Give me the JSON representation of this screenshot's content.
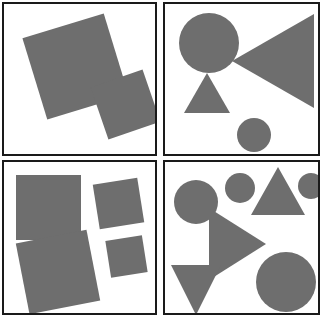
{
  "figure": {
    "width": 323,
    "height": 318,
    "background_color": "#ffffff",
    "shape_fill_color": "#6e6e6e",
    "border_color": "#1a1a1a",
    "layout": "2x2-grid-of-bordered-panels",
    "panel_count": 4
  },
  "panels": [
    {
      "id": "top-left",
      "position": "top-left",
      "shape_count": 2,
      "shapes": [
        {
          "name": "square-large-rotated",
          "type": "square",
          "size": 85,
          "rotation_deg": -17,
          "center_x": 72,
          "center_y": 63
        },
        {
          "name": "square-small-rotated",
          "type": "square",
          "size": 55,
          "rotation_deg": -19,
          "center_x": 122,
          "center_y": 101
        }
      ]
    },
    {
      "id": "top-right",
      "position": "top-right",
      "shape_count": 4,
      "shapes": [
        {
          "name": "circle-large",
          "type": "circle",
          "diameter": 60,
          "center_x": 44,
          "center_y": 39
        },
        {
          "name": "triangle-left-pointing-large",
          "type": "triangle",
          "direction": "left",
          "width": 82,
          "height": 94,
          "center_x": 108,
          "center_y": 57
        },
        {
          "name": "triangle-up-pointing-small",
          "type": "triangle",
          "direction": "up",
          "width": 46,
          "height": 40,
          "center_x": 42,
          "center_y": 89
        },
        {
          "name": "circle-small",
          "type": "circle",
          "diameter": 34,
          "center_x": 89,
          "center_y": 131
        }
      ]
    },
    {
      "id": "bottom-left",
      "position": "bottom-left",
      "shape_count": 4,
      "shapes": [
        {
          "name": "square-large-upright",
          "type": "square",
          "size": 65,
          "rotation_deg": 0,
          "center_x": 45,
          "center_y": 45
        },
        {
          "name": "square-medium-rotated-upper-right",
          "type": "square",
          "size": 45,
          "rotation_deg": -9,
          "center_x": 114,
          "center_y": 42
        },
        {
          "name": "square-large-rotated-lower-left",
          "type": "square",
          "size": 72,
          "rotation_deg": -11,
          "center_x": 54,
          "center_y": 110
        },
        {
          "name": "square-small-rotated-lower-right",
          "type": "square",
          "size": 37,
          "rotation_deg": -9,
          "center_x": 122,
          "center_y": 94
        }
      ]
    },
    {
      "id": "bottom-right",
      "position": "bottom-right",
      "shape_count": 7,
      "shapes": [
        {
          "name": "circle-medium-left",
          "type": "circle",
          "diameter": 44,
          "center_x": 31,
          "center_y": 40
        },
        {
          "name": "circle-small-top",
          "type": "circle",
          "diameter": 30,
          "center_x": 75,
          "center_y": 26
        },
        {
          "name": "triangle-up-pointing",
          "type": "triangle",
          "direction": "up",
          "width": 54,
          "height": 48,
          "center_x": 113,
          "center_y": 29
        },
        {
          "name": "circle-tiny-top-right",
          "type": "circle",
          "diameter": 26,
          "center_x": 146,
          "center_y": 24
        },
        {
          "name": "triangle-right-pointing",
          "type": "triangle",
          "direction": "right",
          "width": 57,
          "height": 72,
          "center_x": 72,
          "center_y": 82
        },
        {
          "name": "triangle-down-pointing",
          "type": "triangle",
          "direction": "down",
          "width": 50,
          "height": 50,
          "center_x": 31,
          "center_y": 128
        },
        {
          "name": "circle-large-bottom-right",
          "type": "circle",
          "diameter": 60,
          "center_x": 121,
          "center_y": 120
        }
      ]
    }
  ]
}
